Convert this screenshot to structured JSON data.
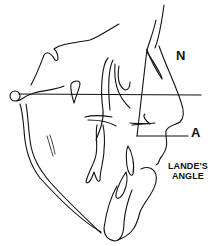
{
  "figure": {
    "type": "cephalometric-tracing",
    "labels": {
      "nasion": "N",
      "point_a": "A",
      "angle_line1": "LANDE'S",
      "angle_line2": "ANGLE"
    },
    "colors": {
      "line": "#111111",
      "background": "#ffffff"
    }
  }
}
